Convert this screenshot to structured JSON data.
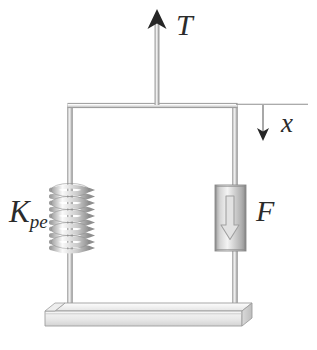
{
  "figure": {
    "background_color": "#ffffff",
    "ink_color": "#2b2b2b",
    "line_color": "#a8a8a8",
    "metal_light": "#f2f2f2",
    "metal_mid": "#cfcfcf",
    "metal_dark": "#9a9a9a"
  },
  "labels": {
    "tension": "T",
    "displacement": "x",
    "force": "F",
    "stiffness_symbol": "K",
    "stiffness_subscript": "pe"
  },
  "elements": {
    "tension_arrow": {
      "name": "tension-arrow",
      "direction": "up",
      "x": 157,
      "tip_y": 10,
      "tail_y": 104
    },
    "displacement_arrow": {
      "name": "displacement-arrow",
      "direction": "down",
      "x": 263,
      "top_y": 105,
      "tip_y": 141
    },
    "reference_line": {
      "name": "displacement-reference-line",
      "from_x": 236,
      "to_x": 307,
      "y": 104
    },
    "top_bar": {
      "name": "top-crossbar",
      "from_x": 68,
      "to_x": 237,
      "y": 105
    },
    "left_rod": {
      "name": "left-vertical-rod",
      "x": 70,
      "top_y": 105,
      "bottom_y": 308
    },
    "right_rod": {
      "name": "right-vertical-rod",
      "x": 235,
      "top_y": 105,
      "bottom_y": 308
    },
    "spring": {
      "name": "coil-spring",
      "center_x": 70,
      "top_y": 186,
      "bottom_y": 251,
      "coil_count": 10,
      "coil_half_width": 19
    },
    "damper": {
      "name": "damper-cylinder",
      "left_x": 215,
      "right_x": 246,
      "top_y": 185,
      "bottom_y": 251
    },
    "inner_force_arrow": {
      "name": "damper-force-arrow",
      "direction": "down",
      "x": 230,
      "top_y": 196,
      "tip_y": 239
    },
    "base": {
      "name": "ground-base-slab",
      "left_x": 45,
      "right_x": 252,
      "top_y": 303,
      "bottom_y": 326,
      "depth_offset_x": 10,
      "depth_offset_y": 8
    }
  }
}
